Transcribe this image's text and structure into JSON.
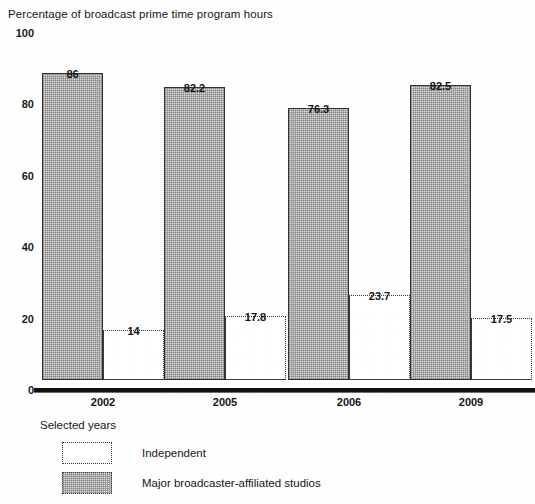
{
  "chart_data": {
    "type": "bar",
    "title": "Percentage of broadcast prime time program hours",
    "xlabel": "Selected years",
    "ylabel": "",
    "categories": [
      "2002",
      "2005",
      "2006",
      "2009"
    ],
    "series": [
      {
        "name": "Major broadcaster-affiliated studios",
        "values": [
          86,
          82.2,
          76.3,
          82.5
        ],
        "labels": [
          "86",
          "82.2",
          "76.3",
          "82.5"
        ],
        "fill": "shaded",
        "color": "#dcdcdc"
      },
      {
        "name": "Independent",
        "values": [
          14,
          17.8,
          23.7,
          17.5
        ],
        "labels": [
          "14",
          "17.8",
          "23.7",
          "17.5"
        ],
        "fill": "open",
        "color": "#ffffff"
      }
    ],
    "ylim": [
      0,
      100
    ],
    "yticks": [
      "0",
      "20",
      "40",
      "60",
      "80",
      "100"
    ],
    "ytick_values": [
      0,
      20,
      40,
      60,
      80,
      100
    ],
    "grid": false,
    "legend_position": "bottom-left",
    "legend": [
      {
        "label": "Independent",
        "fill": "open"
      },
      {
        "label": "Major broadcaster-affiliated studios",
        "fill": "shaded"
      }
    ]
  }
}
